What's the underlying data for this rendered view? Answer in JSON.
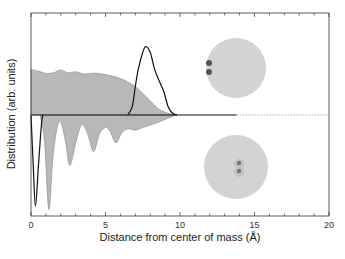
{
  "chart_data": {
    "type": "area",
    "title": "",
    "xlabel": "Distance from center of mass (Å)",
    "ylabel": "Distribution (arb. units)",
    "xlim": [
      0,
      20
    ],
    "xticks": [
      0,
      5,
      10,
      15,
      20
    ],
    "minor_tick_step": 1,
    "grid": false,
    "legend": null,
    "baseline": {
      "solid_until_x": 13.8,
      "dotted_after": true
    },
    "series": [
      {
        "name": "upper-filled (droplet density, molecule at surface)",
        "style": "filled-gray",
        "direction": "up",
        "x": [
          0,
          0.5,
          1.0,
          1.5,
          2.0,
          2.5,
          3.0,
          3.5,
          4.0,
          4.5,
          5.0,
          5.5,
          6.0,
          6.5,
          7.0,
          7.5,
          8.0,
          8.5,
          9.0,
          9.5,
          9.8
        ],
        "y": [
          0.8,
          0.77,
          0.73,
          0.74,
          0.79,
          0.74,
          0.76,
          0.72,
          0.73,
          0.73,
          0.71,
          0.68,
          0.64,
          0.58,
          0.5,
          0.38,
          0.25,
          0.12,
          0.05,
          0.01,
          0.0
        ]
      },
      {
        "name": "upper-line (molecule position, surface)",
        "style": "black-line",
        "direction": "up",
        "x": [
          6.5,
          6.8,
          7.0,
          7.2,
          7.5,
          7.7,
          8.0,
          8.3,
          8.6,
          8.9,
          9.2,
          9.5,
          9.8
        ],
        "y": [
          0.0,
          0.15,
          0.5,
          0.8,
          1.1,
          1.2,
          1.1,
          0.8,
          0.6,
          0.42,
          0.15,
          0.03,
          0.0
        ]
      },
      {
        "name": "lower-filled (droplet density, molecule at center)",
        "style": "filled-gray",
        "direction": "down",
        "x": [
          0.6,
          0.9,
          1.2,
          1.5,
          1.9,
          2.3,
          2.6,
          3.0,
          3.4,
          3.8,
          4.2,
          4.6,
          5.0,
          5.3,
          5.7,
          6.1,
          6.5,
          7.0,
          7.5,
          8.0,
          8.5,
          9.0,
          9.5,
          9.7
        ],
        "y": [
          0.0,
          0.4,
          1.5,
          0.6,
          0.1,
          0.4,
          0.8,
          0.45,
          0.15,
          0.3,
          0.58,
          0.3,
          0.2,
          0.26,
          0.44,
          0.28,
          0.22,
          0.24,
          0.2,
          0.16,
          0.12,
          0.07,
          0.02,
          0.0
        ]
      },
      {
        "name": "lower-line (molecule position, center)",
        "style": "black-line",
        "direction": "down",
        "x": [
          0,
          0.15,
          0.3,
          0.5,
          0.7,
          0.8
        ],
        "y": [
          0.0,
          0.8,
          1.45,
          0.8,
          0.15,
          0.0
        ]
      }
    ],
    "annotations": [
      {
        "type": "inset-image",
        "description": "droplet with molecule at surface",
        "position": "upper-right"
      },
      {
        "type": "inset-image",
        "description": "droplet with molecule at center",
        "position": "lower-right"
      }
    ]
  },
  "axes": {
    "x_tick_labels": [
      "0",
      "5",
      "10",
      "15",
      "20"
    ],
    "xlabel": "Distance from center of mass (Å)",
    "ylabel": "Distribution (arb. units)"
  }
}
